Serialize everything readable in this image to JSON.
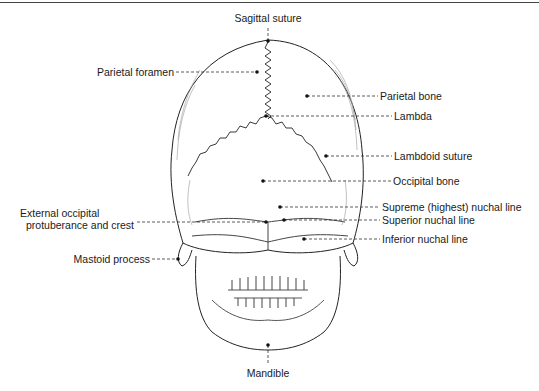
{
  "figure": {
    "labels": {
      "sagittal_suture": "Sagittal suture",
      "parietal_foramen": "Parietal foramen",
      "parietal_bone": "Parietal bone",
      "lambda": "Lambda",
      "lambdoid_suture": "Lambdoid suture",
      "occipital_bone": "Occipital bone",
      "external_occipital_line1": "External occipital",
      "external_occipital_line2": "protuberance and crest",
      "supreme_nuchal_line": "Supreme (highest) nuchal line",
      "superior_nuchal_line": "Superior nuchal line",
      "inferior_nuchal_line": "Inferior nuchal line",
      "mastoid_process": "Mastoid process",
      "mandible": "Mandible"
    }
  }
}
